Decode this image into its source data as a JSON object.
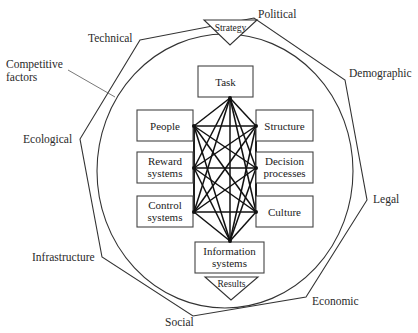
{
  "diagram": {
    "type": "organizational-environment-model",
    "environment_factors": [
      {
        "id": "technical",
        "label": "Technical"
      },
      {
        "id": "political",
        "label": "Political"
      },
      {
        "id": "demographic",
        "label": "Demographic"
      },
      {
        "id": "legal",
        "label": "Legal"
      },
      {
        "id": "economic",
        "label": "Economic"
      },
      {
        "id": "social",
        "label": "Social"
      },
      {
        "id": "infrastructure",
        "label": "Infrastructure"
      },
      {
        "id": "ecological",
        "label": "Ecological"
      }
    ],
    "competitive_factors": {
      "line1": "Competitive",
      "line2": "factors"
    },
    "strategy": {
      "label": "Strategy"
    },
    "results": {
      "label": "Results"
    },
    "nodes": {
      "task": {
        "line1": "Task"
      },
      "people": {
        "line1": "People"
      },
      "structure": {
        "line1": "Structure"
      },
      "reward": {
        "line1": "Reward",
        "line2": "systems"
      },
      "decision": {
        "line1": "Decision",
        "line2": "processes"
      },
      "control": {
        "line1": "Control",
        "line2": "systems"
      },
      "culture": {
        "line1": "Culture"
      },
      "information": {
        "line1": "Information",
        "line2": "systems"
      }
    },
    "note": "All eight internal elements are fully interconnected"
  }
}
